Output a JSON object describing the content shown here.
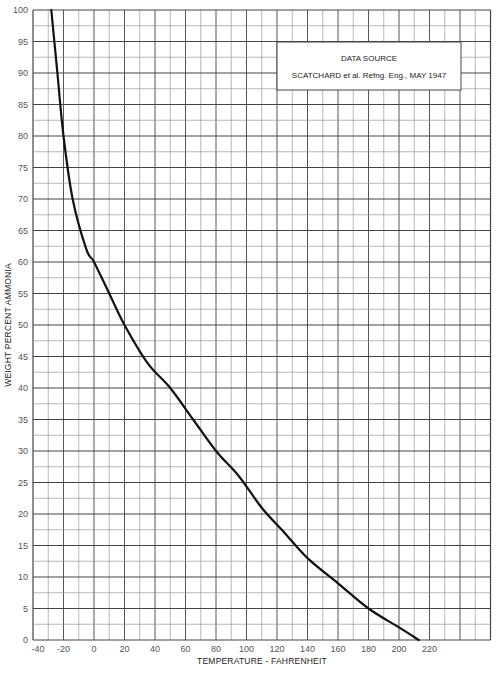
{
  "chart_data": {
    "type": "line",
    "title": "",
    "xlabel": "TEMPERATURE - FAHRENHEIT",
    "ylabel": "WEIGHT PERCENT AMMONIA",
    "xlim": [
      -40,
      260
    ],
    "ylim": [
      0,
      100
    ],
    "x_ticks": [
      -40,
      -20,
      0,
      20,
      40,
      60,
      80,
      100,
      120,
      140,
      160,
      180,
      200,
      220
    ],
    "y_ticks": [
      0,
      5,
      10,
      15,
      20,
      25,
      30,
      35,
      40,
      45,
      50,
      55,
      60,
      65,
      70,
      75,
      80,
      85,
      90,
      95,
      100
    ],
    "grid": true,
    "x_grid_step": 10,
    "y_grid_step": 2.5,
    "legend": null,
    "annotation": {
      "line1": "DATA SOURCE",
      "line2": "SCATCHARD et al. Refng. Eng., MAY 1947",
      "position": "top-right"
    },
    "series": [
      {
        "name": "Ammonia-water boiling curve",
        "x": [
          -28,
          -24,
          -20,
          -14,
          -5,
          0,
          10,
          20,
          35,
          50,
          65,
          80,
          95,
          110,
          125,
          140,
          160,
          180,
          200,
          213
        ],
        "y": [
          100,
          90,
          80,
          70,
          62,
          60,
          55,
          50,
          44,
          40,
          35,
          30,
          26,
          21,
          17,
          13,
          9,
          5,
          2,
          0
        ]
      }
    ]
  },
  "axes": {
    "xlabel": "TEMPERATURE - FAHRENHEIT",
    "ylabel": "WEIGHT PERCENT AMMONIA"
  },
  "source_box": {
    "line1": "DATA SOURCE",
    "line2": "SCATCHARD et al. Refng. Eng., MAY 1947"
  },
  "colors": {
    "grid": "#8a8a8a",
    "grid_major": "#444444",
    "curve": "#111111",
    "background": "#ffffff"
  }
}
